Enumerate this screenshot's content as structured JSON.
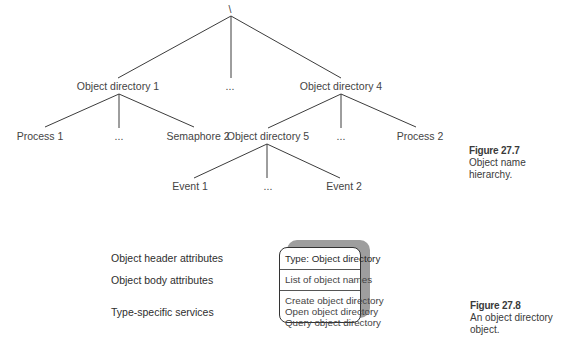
{
  "figure_27_7": {
    "caption_number": "Figure 27.7",
    "caption_lines": [
      "Object name",
      "hierarchy."
    ],
    "root": "\\",
    "level1": [
      {
        "label": "Object directory 1",
        "x": 118
      },
      {
        "label": "...",
        "x": 230
      },
      {
        "label": "Object directory 4",
        "x": 341
      }
    ],
    "level2_dir1": [
      {
        "label": "Process 1",
        "x": 40
      },
      {
        "label": "...",
        "x": 119
      },
      {
        "label": "Semaphore 2",
        "x": 198
      }
    ],
    "level2_dir4": [
      {
        "label": "Object directory 5",
        "x": 268
      },
      {
        "label": "...",
        "x": 341
      },
      {
        "label": "Process 2",
        "x": 420
      }
    ],
    "level3_dir5": [
      {
        "label": "Event 1",
        "x": 190
      },
      {
        "label": "...",
        "x": 268
      },
      {
        "label": "Event 2",
        "x": 344
      }
    ]
  },
  "figure_27_8": {
    "caption_number": "Figure 27.8",
    "caption_lines": [
      "An object directory",
      "object."
    ],
    "row_labels": {
      "header": "Object header attributes",
      "body": "Object body attributes",
      "services": "Type-specific services"
    },
    "box": {
      "header": "Type: Object directory",
      "body": "List of object names",
      "services": [
        "Create object directory",
        "Open object directory",
        "Query object directory"
      ]
    }
  },
  "colors": {
    "line": "#3c3c3c",
    "shadow": "#9e9e9e",
    "text": "#444444"
  }
}
